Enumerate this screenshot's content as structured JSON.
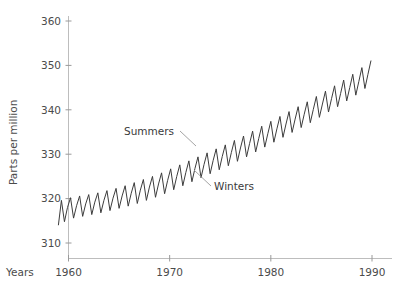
{
  "chart_data": {
    "type": "line",
    "title": "",
    "subtitle": "",
    "xlabel": "Years",
    "ylabel": "Parts per million",
    "xlim": [
      1959.0,
      1990.0
    ],
    "ylim": [
      308.0,
      362.0
    ],
    "xticks": [
      1960,
      1970,
      1980,
      1990
    ],
    "xtick_labels": [
      "1960",
      "1970",
      "1980",
      "1990"
    ],
    "yticks": [
      310,
      320,
      330,
      340,
      350,
      360
    ],
    "ytick_labels": [
      "310",
      "320",
      "330",
      "340",
      "350",
      "360"
    ],
    "grid": false,
    "legend": "none",
    "line_color": "#3c3c3c",
    "axis_color": "#bdbdbd",
    "annotations": [
      {
        "name": "summers-annotation",
        "text": "Summers",
        "text_x": 124,
        "text_y": 135,
        "leader_from_x": 180,
        "leader_from_y": 131,
        "leader_to_x": 196,
        "leader_to_y": 146
      },
      {
        "name": "winters-annotation",
        "text": "Winters",
        "text_x": 214,
        "text_y": 190,
        "leader_from_x": 211,
        "leader_from_y": 186,
        "leader_to_x": 194,
        "leader_to_y": 170
      }
    ],
    "series": [
      {
        "name": "Atmospheric CO2 concentration",
        "description": "Monthly mean CO2 with seasonal oscillation: summer peaks, winter troughs",
        "x": [
          1959.0,
          1959.3,
          1959.6,
          1959.9,
          1960.2,
          1960.5,
          1960.8,
          1961.1,
          1961.4,
          1961.7,
          1962.0,
          1962.3,
          1962.6,
          1962.9,
          1963.2,
          1963.5,
          1963.8,
          1964.1,
          1964.4,
          1964.7,
          1965.0,
          1965.3,
          1965.6,
          1965.9,
          1966.2,
          1966.5,
          1966.8,
          1967.1,
          1967.4,
          1967.7,
          1968.0,
          1968.3,
          1968.6,
          1968.9,
          1969.2,
          1969.5,
          1969.8,
          1970.1,
          1970.4,
          1970.7,
          1971.0,
          1971.3,
          1971.6,
          1971.9,
          1972.2,
          1972.5,
          1972.8,
          1973.1,
          1973.4,
          1973.7,
          1974.0,
          1974.3,
          1974.6,
          1974.9,
          1975.2,
          1975.5,
          1975.8,
          1976.1,
          1976.4,
          1976.7,
          1977.0,
          1977.3,
          1977.6,
          1977.9,
          1978.2,
          1978.5,
          1978.8,
          1979.1,
          1979.4,
          1979.7,
          1980.0,
          1980.3,
          1980.6,
          1980.9,
          1981.2,
          1981.5,
          1981.8,
          1982.1,
          1982.4,
          1982.7,
          1983.0,
          1983.3,
          1983.6,
          1983.9,
          1984.2,
          1984.5,
          1984.8,
          1985.1,
          1985.4,
          1985.7,
          1986.0,
          1986.3,
          1986.6,
          1986.9,
          1987.2,
          1987.5,
          1987.8,
          1988.1,
          1988.4,
          1988.7,
          1989.0,
          1989.3,
          1989.6,
          1989.9
        ],
        "y": [
          314.0,
          319.6,
          314.8,
          318.0,
          320.2,
          315.6,
          318.4,
          320.6,
          316.0,
          318.8,
          320.9,
          316.4,
          319.2,
          321.3,
          316.8,
          319.6,
          321.8,
          317.3,
          320.1,
          322.3,
          317.8,
          320.6,
          322.9,
          318.3,
          321.2,
          323.6,
          318.9,
          321.9,
          324.3,
          319.6,
          322.6,
          325.0,
          320.3,
          323.3,
          325.8,
          321.1,
          324.1,
          326.7,
          322.0,
          325.0,
          327.6,
          322.9,
          325.9,
          328.5,
          323.8,
          326.8,
          329.4,
          324.7,
          327.7,
          330.3,
          325.6,
          328.6,
          331.2,
          326.5,
          329.5,
          332.1,
          327.4,
          330.4,
          333.1,
          328.4,
          331.4,
          334.1,
          329.4,
          332.4,
          335.2,
          330.5,
          333.5,
          336.3,
          331.6,
          334.6,
          337.4,
          332.7,
          335.7,
          338.5,
          333.8,
          336.8,
          339.6,
          334.9,
          337.9,
          340.7,
          336.0,
          339.0,
          341.8,
          337.1,
          340.1,
          343.0,
          338.3,
          341.3,
          344.2,
          339.5,
          342.5,
          345.4,
          340.7,
          343.7,
          346.7,
          342.0,
          345.0,
          348.0,
          343.3,
          346.4,
          349.5,
          344.8,
          348.0,
          351.1
        ],
        "peaks_label": "Summers",
        "troughs_label": "Winters",
        "final_peak_value": 355.6,
        "final_value": 351.1,
        "start_value": 314.0,
        "seasonal_amplitude_ppm": 6.0
      }
    ]
  },
  "axes": {
    "y_axis_name": "parts-per-million-axis",
    "x_axis_name": "years-axis"
  }
}
